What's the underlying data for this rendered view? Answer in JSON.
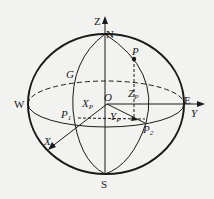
{
  "figure": {
    "points": {
      "Z": "Z",
      "N": "N",
      "S": "S",
      "W": "W",
      "E": "E",
      "O": "O",
      "G": "G",
      "P": "P",
      "P1": "P",
      "P1_sub": "1",
      "P2": "P",
      "P2_sub": "2",
      "Zp": "Z",
      "Zp_sub": "P",
      "Xp": "X",
      "Xp_sub": "P",
      "Yp": "Y",
      "Yp_sub": "P",
      "X": "X",
      "Y": "Y"
    },
    "colors": {
      "stroke": "#1a1a1a",
      "background": "#f2f2f0"
    }
  }
}
